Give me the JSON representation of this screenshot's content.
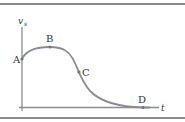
{
  "diagram": {
    "y_axis_label": "v",
    "y_axis_subscript": "s",
    "x_axis_label": "t",
    "points": [
      {
        "label": "A"
      },
      {
        "label": "B"
      },
      {
        "label": "C"
      },
      {
        "label": "D"
      }
    ],
    "colors": {
      "curve": "#8a8a9a",
      "axes": "#8c8c8c",
      "frame": "#8c8c8c",
      "text": "#333333"
    }
  }
}
